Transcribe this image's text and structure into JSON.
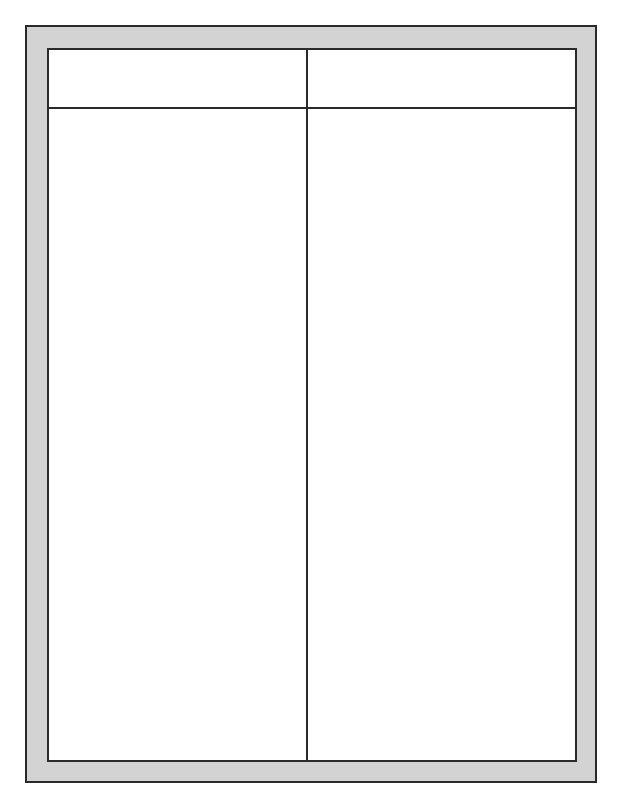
{
  "document": {
    "type": "t-chart-template",
    "columns": [
      {
        "heading": "",
        "content": ""
      },
      {
        "heading": "",
        "content": ""
      }
    ],
    "colors": {
      "frame": "#d3d3d3",
      "lines": "#2a2a2a",
      "background": "#ffffff"
    }
  }
}
